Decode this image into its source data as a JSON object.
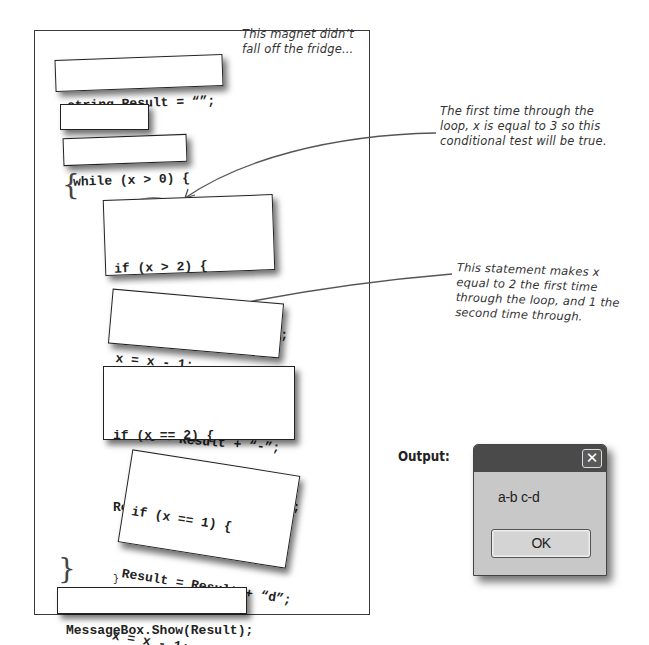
{
  "magnets": [
    {
      "name": "string-result-magnet",
      "lines": [
        "string Result = “”;"
      ]
    },
    {
      "name": "int-x-magnet",
      "lines": [
        "int x = 3;"
      ]
    },
    {
      "name": "while-magnet",
      "lines": [
        "while (x > 0) {"
      ]
    },
    {
      "name": "if-x-gt-2-magnet",
      "lines": [
        "if (x > 2) {",
        "Result = Result + “a”;",
        "}"
      ]
    },
    {
      "name": "decrement-magnet",
      "lines": [
        "x = x - 1;",
        "Result = Result + “-”;"
      ]
    },
    {
      "name": "if-x-eq-2-magnet",
      "lines": [
        "if (x == 2) {",
        "Result = Result + “b c”;",
        "}"
      ]
    },
    {
      "name": "if-x-eq-1-magnet",
      "lines": [
        "if (x == 1) {",
        "Result = Result + “d”;",
        "x = x - 1;",
        "}"
      ]
    },
    {
      "name": "messagebox-magnet",
      "lines": [
        "MessageBox.Show(Result);"
      ]
    }
  ],
  "braces": {
    "open": "{",
    "close": "}"
  },
  "notes": {
    "fridge": "This magnet didn’t fall off the fridge...",
    "first_time": "The first time through the loop, x is equal to 3 so this conditional test will be true.",
    "statement": "This statement makes x equal to 2 the first time through the loop, and 1 the second time through."
  },
  "output": {
    "label": "Output:",
    "dialog": {
      "message": "a-b c-d",
      "ok_label": "OK",
      "close_glyph": "✕"
    }
  }
}
